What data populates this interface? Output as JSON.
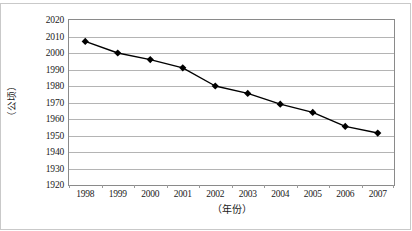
{
  "chart_data": {
    "type": "line",
    "title": "",
    "subtitle": "",
    "xlabel": "（年份）",
    "ylabel": "（公顷）",
    "categories": [
      "1998",
      "1999",
      "2000",
      "2001",
      "2002",
      "2003",
      "2004",
      "2005",
      "2006",
      "2007"
    ],
    "series": [
      {
        "name": "",
        "values": [
          2007,
          2000,
          1996,
          1991,
          1980,
          1975.5,
          1969,
          1964,
          1955.5,
          1951.5
        ]
      }
    ],
    "ylim": [
      1920,
      2020
    ],
    "ytick_step": 10,
    "yticks": [
      2020,
      2010,
      2000,
      1990,
      1980,
      1970,
      1960,
      1950,
      1940,
      1930,
      1920
    ],
    "grid": true,
    "grid_axis": "y",
    "legend": "none",
    "marker": "diamond",
    "marker_color": "#000000",
    "line_color": "#000000",
    "gridline_color": "#b4b4b4",
    "axis_color": "#8a8a8a",
    "background": "#ffffff"
  }
}
